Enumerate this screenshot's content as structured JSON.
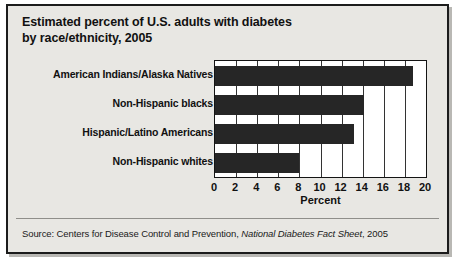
{
  "figure": {
    "title_line1": "Estimated percent of U.S. adults with diabetes",
    "title_line2": "by race/ethnicity, 2005",
    "source_prefix": "Source: Centers for Disease Control and Prevention, ",
    "source_italic": "National Diabetes Fact Sheet",
    "source_suffix": ", 2005"
  },
  "chart_data": {
    "type": "bar",
    "orientation": "horizontal",
    "title": "Estimated percent of U.S. adults with diabetes by race/ethnicity, 2005",
    "categories": [
      "American Indians/Alaska Natives",
      "Non-Hispanic blacks",
      "Hispanic/Latino Americans",
      "Non-Hispanic whites"
    ],
    "values": [
      18.8,
      14.1,
      13.2,
      8.0
    ],
    "xlabel": "Percent",
    "ylabel": "",
    "xlim": [
      0,
      20
    ],
    "xticks": [
      0,
      2,
      4,
      6,
      8,
      10,
      12,
      14,
      16,
      18,
      20
    ],
    "xtick_labels": [
      "0",
      "2",
      "4",
      "6",
      "8",
      "10",
      "12",
      "14",
      "16",
      "18",
      "20"
    ],
    "grid": "vertical",
    "legend": "none",
    "bar_color": "#262626"
  }
}
